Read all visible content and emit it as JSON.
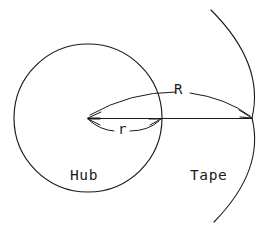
{
  "figure": {
    "type": "technical-diagram",
    "background_color": "#ffffff",
    "stroke_color": "#1a1a1a",
    "width": 269,
    "height": 232
  },
  "labels": {
    "hub": "Hub",
    "tape": "Tape",
    "outer_radius_symbol": "R",
    "inner_radius_symbol": "r"
  },
  "geometry": {
    "hub_circle": {
      "name": "hub-circle",
      "center_x": 88,
      "center_y": 118,
      "radius": 74
    },
    "tape_arc": {
      "name": "tape-arc",
      "start_x": 211,
      "start_y": 10,
      "end_x": 214,
      "end_y": 222,
      "apex_x": 252,
      "apex_y": 118
    },
    "radius_line": {
      "name": "center-to-tape-line",
      "from_x": 88,
      "from_y": 118,
      "to_x": 252,
      "to_y": 118
    },
    "outer_radius_arrow": {
      "name": "R-arrow",
      "from_x": 88,
      "from_y": 118,
      "to_x": 252,
      "to_y": 118,
      "bow_y": 94
    },
    "inner_radius_arrow": {
      "name": "r-arrow",
      "from_x": 88,
      "from_y": 118,
      "to_x": 161,
      "to_y": 119,
      "bow_y": 132
    }
  },
  "label_positions": {
    "hub_x": 70,
    "hub_y": 180,
    "tape_x": 190,
    "tape_y": 180,
    "R_x": 172,
    "R_y": 94,
    "r_x": 117,
    "r_y": 133
  }
}
